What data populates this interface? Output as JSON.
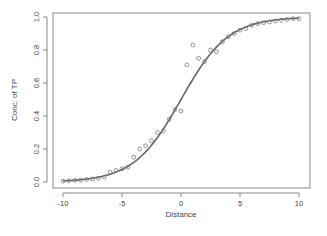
{
  "chart_data": {
    "type": "scatter",
    "title": "",
    "xlabel": "Distance",
    "ylabel": "Conc. of TP",
    "xlim": [
      -10,
      10
    ],
    "ylim": [
      0,
      1
    ],
    "grid": false,
    "legend": null,
    "xticks": [
      -10,
      -5,
      0,
      5,
      10
    ],
    "yticks": [
      0.0,
      0.2,
      0.4,
      0.6,
      0.8,
      1.0
    ],
    "xtick_labels": [
      "-10",
      "-5",
      "0",
      "5",
      "10"
    ],
    "ytick_labels": [
      "0.0",
      "0.2",
      "0.4",
      "0.6",
      "0.8",
      "1.0"
    ],
    "series": [
      {
        "name": "observed",
        "style": "open-circles",
        "color": "#777777",
        "x": [
          -10,
          -9.5,
          -9,
          -8.5,
          -8,
          -7.5,
          -7,
          -6.5,
          -6,
          -5.5,
          -5,
          -4.5,
          -4,
          -3.5,
          -3,
          -2.5,
          -2,
          -1.5,
          -1,
          -0.5,
          0,
          0.5,
          1,
          1.5,
          2,
          2.5,
          3,
          3.5,
          4,
          4.5,
          5,
          5.5,
          6,
          6.5,
          7,
          7.5,
          8,
          8.5,
          9,
          9.5,
          10
        ],
        "y": [
          0.005,
          0.008,
          0.01,
          0.012,
          0.015,
          0.018,
          0.022,
          0.03,
          0.06,
          0.07,
          0.08,
          0.09,
          0.15,
          0.2,
          0.22,
          0.25,
          0.3,
          0.31,
          0.38,
          0.44,
          0.43,
          0.71,
          0.83,
          0.75,
          0.73,
          0.8,
          0.79,
          0.85,
          0.88,
          0.9,
          0.92,
          0.93,
          0.95,
          0.96,
          0.965,
          0.97,
          0.975,
          0.98,
          0.985,
          0.99,
          0.99
        ]
      },
      {
        "name": "fitted",
        "style": "line",
        "color": "#666666",
        "model": "logistic",
        "params": {
          "k": 0.5,
          "x0": 0.0
        }
      }
    ]
  }
}
